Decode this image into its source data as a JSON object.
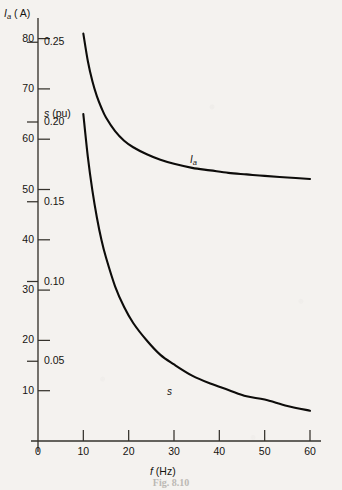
{
  "chart_data": {
    "type": "line",
    "title": "",
    "xlabel": "f (Hz)",
    "ylabel_primary": "I_a ( A)",
    "ylabel_secondary": "s (pu)",
    "xlim": [
      0,
      62
    ],
    "ylim_primary": [
      0,
      86
    ],
    "ylim_secondary": [
      0,
      0.272
    ],
    "grid": false,
    "legend": "inline-labels",
    "x_ticks": [
      0,
      10,
      20,
      30,
      40,
      50,
      60
    ],
    "x_tick_labels": [
      "0",
      "10",
      "20",
      "30",
      "40",
      "50",
      "60"
    ],
    "y_ticks_primary": [
      10,
      20,
      30,
      40,
      50,
      60,
      70,
      80
    ],
    "y_tick_labels_primary": [
      "10",
      "20",
      "30",
      "40",
      "50",
      "60",
      "70",
      "80"
    ],
    "y_ticks_secondary": [
      0.05,
      0.1,
      0.15,
      0.2,
      0.25
    ],
    "y_tick_labels_secondary": [
      "0.05",
      "0.10",
      "0.15",
      "0.20",
      "0.25"
    ],
    "series": [
      {
        "name": "I_a",
        "axis": "primary",
        "unit": "A",
        "label_text": "I_a",
        "x": [
          10,
          11,
          12,
          13,
          14,
          15,
          17,
          19,
          21,
          24,
          27,
          30,
          34,
          38,
          42,
          46,
          50,
          55,
          60
        ],
        "values": [
          81.0,
          75.5,
          71.5,
          68.5,
          66.2,
          64.3,
          61.6,
          59.7,
          58.4,
          57.0,
          55.9,
          55.1,
          54.3,
          53.8,
          53.3,
          53.0,
          52.7,
          52.4,
          52.1
        ]
      },
      {
        "name": "s",
        "axis": "secondary",
        "unit": "pu",
        "label_text": "s",
        "x": [
          10,
          11,
          12,
          13,
          14,
          15,
          17,
          19,
          21,
          24,
          27,
          30,
          34,
          38,
          42,
          46,
          50,
          55,
          60
        ],
        "values": [
          0.205,
          0.178,
          0.157,
          0.14,
          0.126,
          0.115,
          0.097,
          0.084,
          0.074,
          0.063,
          0.054,
          0.048,
          0.041,
          0.036,
          0.032,
          0.028,
          0.026,
          0.022,
          0.019
        ]
      }
    ]
  },
  "axes": {
    "x_axis_title": "f (Hz)",
    "y_axis_primary_symbol": "I",
    "y_axis_primary_sub": "a",
    "y_axis_primary_unit": "( A)",
    "y_axis_secondary_symbol": "s",
    "y_axis_secondary_unit": "(pu)"
  },
  "curve_labels": {
    "current_symbol": "I",
    "current_sub": "a",
    "slip_symbol": "s"
  },
  "caption": "Fig. 8.10",
  "colors": {
    "page_background": "#f4f2ef",
    "ink": "#16140f",
    "axis": "#3a3731",
    "curve": "#0d0c0a"
  }
}
